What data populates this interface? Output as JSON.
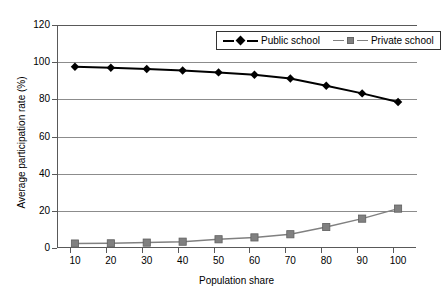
{
  "chart_data": {
    "type": "line",
    "title": "",
    "xlabel": "Population share",
    "ylabel": "Average participation rate (%)",
    "x": [
      10,
      20,
      30,
      40,
      50,
      60,
      70,
      80,
      90,
      100
    ],
    "xtick_labels": [
      "10",
      "20",
      "30",
      "40",
      "50",
      "60",
      "70",
      "80",
      "90",
      "100"
    ],
    "ytick_labels": [
      "0",
      "20",
      "40",
      "60",
      "80",
      "100",
      "120"
    ],
    "ytick_values": [
      0,
      20,
      40,
      60,
      80,
      100,
      120
    ],
    "xlim": [
      5,
      105
    ],
    "ylim": [
      0,
      120
    ],
    "grid": "horizontal",
    "legend_position": "top-right-inside",
    "series": [
      {
        "name": "Public school",
        "color": "#000000",
        "marker": "diamond",
        "values": [
          97.5,
          97.0,
          96.3,
          95.5,
          94.5,
          93.2,
          91.2,
          87.3,
          83.2,
          78.6
        ]
      },
      {
        "name": "Private school",
        "color": "#808080",
        "marker": "square",
        "values": [
          2.4,
          2.5,
          2.9,
          3.4,
          4.7,
          5.7,
          7.4,
          11.3,
          15.8,
          21.2
        ]
      }
    ]
  },
  "legend": {
    "entries": [
      {
        "label": "Public school"
      },
      {
        "label": "Private school"
      }
    ]
  },
  "axes": {
    "y_title": "Average participation rate (%)",
    "x_title": "Population share"
  }
}
